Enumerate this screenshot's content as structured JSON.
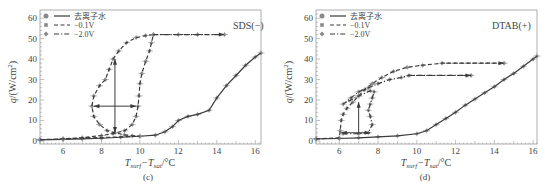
{
  "chart_data": [
    {
      "panel": "(c)",
      "type": "line",
      "annotation": "SDS(−)",
      "xlabel": "T_surf − T_sat/°C",
      "ylabel": "q/(W/cm²)",
      "xlim": [
        4.8,
        16.3
      ],
      "ylim": [
        -1.5,
        64
      ],
      "xticks": [
        6,
        8,
        10,
        12,
        14,
        16
      ],
      "yticks": [
        0,
        10,
        20,
        30,
        40,
        50,
        60
      ],
      "grid": false,
      "legend": {
        "position": "upper-left",
        "entries": [
          {
            "label": "去离子水",
            "style": "solid",
            "marker": "circle"
          },
          {
            "label": "−0.1V",
            "style": "dashed",
            "marker": "square"
          },
          {
            "label": "−2.0V",
            "style": "dashdot",
            "marker": "diamond"
          }
        ]
      },
      "series": [
        {
          "name": "去离子水",
          "style": "solid",
          "x": [
            4.8,
            6,
            7,
            8,
            9,
            10,
            10.8,
            11.3,
            11.7,
            12,
            12.5,
            13,
            13.6,
            14,
            14.5,
            15,
            15.5,
            16,
            16.3
          ],
          "y": [
            0.5,
            0.8,
            1.0,
            1.3,
            1.8,
            2.3,
            2.8,
            4.5,
            7,
            10,
            12,
            13,
            15,
            21,
            27,
            32,
            37,
            41,
            43
          ]
        },
        {
          "name": "−0.1V",
          "style": "dashed",
          "x": [
            4.8,
            6,
            7,
            8,
            8.6,
            9.2,
            9.6,
            9.8,
            9.9,
            9.95,
            10,
            10.1,
            10.3,
            10.5,
            10.6,
            10.7,
            10.3,
            9.8,
            9.3,
            8.9,
            8.6,
            8.4,
            8.2,
            7.9,
            7.6,
            7.5,
            7.6,
            7.9,
            8.3,
            8.7,
            9.2,
            9.6,
            10,
            6,
            4.8
          ],
          "y": [
            0.6,
            1.0,
            1.6,
            2.6,
            3.6,
            5.0,
            8,
            12,
            17,
            22,
            28,
            33,
            39,
            44,
            48,
            52,
            51.5,
            50.5,
            48,
            44,
            40,
            35,
            30,
            27,
            22,
            17,
            12,
            8,
            5,
            4,
            3,
            2.5,
            2.3,
            1.0,
            0.6
          ]
        },
        {
          "name": "−2.0V",
          "style": "dashdot",
          "x": [
            10.7,
            12,
            13,
            14.4
          ],
          "y": [
            52,
            52,
            52,
            52
          ]
        }
      ],
      "arrows": [
        {
          "from": [
            8.7,
            4
          ],
          "to": [
            8.7,
            40
          ],
          "type": "solid",
          "bidirectional": true
        },
        {
          "from": [
            7.6,
            17
          ],
          "to": [
            9.8,
            17
          ],
          "type": "solid",
          "bidirectional": true
        },
        {
          "from": [
            10.7,
            52
          ],
          "to": [
            14.4,
            52
          ],
          "type": "dashed"
        }
      ]
    },
    {
      "panel": "(d)",
      "type": "line",
      "annotation": "DTAB(+)",
      "xlabel": "T_surf − T_sat/°C",
      "ylabel": "q/(W/cm²)",
      "xlim": [
        4.8,
        16.2
      ],
      "ylim": [
        -1.5,
        64
      ],
      "xticks": [
        6,
        8,
        10,
        12,
        14,
        16
      ],
      "yticks": [
        0,
        10,
        20,
        30,
        40,
        50,
        60
      ],
      "grid": false,
      "legend": {
        "position": "upper-left",
        "entries": [
          {
            "label": "去离子水",
            "style": "solid",
            "marker": "circle"
          },
          {
            "label": "−0.1V",
            "style": "dashed",
            "marker": "square"
          },
          {
            "label": "−2.0V",
            "style": "dashdot",
            "marker": "diamond"
          }
        ]
      },
      "series": [
        {
          "name": "去离子水",
          "style": "solid",
          "x": [
            4.8,
            6,
            7,
            8,
            9,
            10,
            10.5,
            11,
            11.5,
            12,
            12.5,
            13,
            13.5,
            14,
            14.5,
            15,
            15.5,
            16,
            16.2
          ],
          "y": [
            1,
            1.2,
            1.5,
            2,
            2.5,
            3.5,
            5,
            8,
            11,
            14,
            17.5,
            20.5,
            23.5,
            26.5,
            30,
            33,
            36.5,
            40,
            41.5
          ]
        },
        {
          "name": "−0.1V",
          "style": "dashed",
          "x": [
            4.8,
            6,
            6.05,
            6.1,
            6.2,
            6.4,
            6.7,
            7.0,
            7.3,
            7.7,
            8.2,
            8.8,
            9.5,
            10.3,
            11.3,
            14.5
          ],
          "y": [
            1,
            1.5,
            5,
            10,
            13,
            16,
            19,
            22,
            25,
            28,
            31,
            34,
            36,
            37,
            38,
            38
          ]
        },
        {
          "name": "−2.0V",
          "style": "dashdot",
          "x": [
            6.2,
            7.0,
            7.5,
            7.7,
            7.6,
            7.5,
            7.6,
            7.7,
            7.8,
            7.6,
            7.0,
            6.2,
            6.6,
            7.0,
            7.5,
            8.0,
            8.6,
            9.2,
            9.6,
            12.8
          ],
          "y": [
            3.5,
            3.5,
            4,
            8,
            12,
            15,
            18,
            21,
            24,
            24.5,
            22,
            18,
            21,
            24,
            26,
            28,
            30,
            31,
            32,
            32
          ]
        }
      ],
      "arrows": [
        {
          "from": [
            7.0,
            3.5
          ],
          "to": [
            7.0,
            19
          ],
          "type": "solid",
          "bidirectional": false
        },
        {
          "from": [
            6.1,
            4
          ],
          "to": [
            7.6,
            4
          ],
          "type": "solid",
          "bidirectional": true
        },
        {
          "from": [
            11.5,
            38
          ],
          "to": [
            14.5,
            38
          ],
          "type": "dashed"
        },
        {
          "from": [
            9.6,
            32
          ],
          "to": [
            12.8,
            32
          ],
          "type": "dashdot"
        }
      ]
    }
  ],
  "panels": {
    "c": {
      "annotation": "SDS(−)",
      "caption": "(c)",
      "ylabel_q": "q",
      "ylabel_unit": "/(W/cm",
      "ylabel_sup": "2",
      "ylabel_close": ")",
      "xlabel_T1": "T",
      "xlabel_sub1": "surf",
      "xlabel_mid": "−T",
      "xlabel_sub2": "sat",
      "xlabel_unit": "/°C"
    },
    "d": {
      "annotation": "DTAB(+)",
      "caption": "(d)",
      "ylabel_q": "q",
      "ylabel_unit": "/(W/cm",
      "ylabel_sup": "2",
      "ylabel_close": ")",
      "xlabel_T1": "T",
      "xlabel_sub1": "surf",
      "xlabel_mid": "−T",
      "xlabel_sub2": "sat",
      "xlabel_unit": "/°C"
    }
  },
  "legend_labels": [
    "去离子水",
    "−0.1V",
    "−2.0V"
  ],
  "tick_labels": {
    "x": [
      "6",
      "8",
      "10",
      "12",
      "14",
      "16"
    ],
    "y": [
      "0",
      "10",
      "20",
      "30",
      "40",
      "50",
      "60"
    ]
  },
  "colors": {
    "line": "#3a3a3a",
    "marker": "#8a8a8a",
    "frame": "#999999",
    "text": "#444444"
  }
}
